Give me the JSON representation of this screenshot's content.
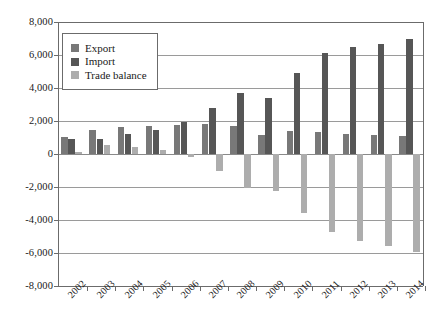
{
  "chart_data": {
    "type": "bar",
    "title": "",
    "subtitle": "",
    "xlabel": "",
    "ylabel": "",
    "categories": [
      "2002",
      "2003",
      "2004",
      "2005",
      "2006",
      "2007",
      "2008",
      "2009",
      "2010",
      "2011",
      "2012",
      "2013",
      "2014"
    ],
    "series": [
      {
        "name": "Export",
        "color": "#787878",
        "values": [
          1050,
          1430,
          1620,
          1700,
          1750,
          1830,
          1680,
          1150,
          1390,
          1340,
          1210,
          1180,
          1090
        ]
      },
      {
        "name": "Import",
        "color": "#565656",
        "values": [
          930,
          880,
          1240,
          1430,
          1950,
          2800,
          3720,
          3380,
          4900,
          6100,
          6500,
          6650,
          6950
        ]
      },
      {
        "name": "Trade balance",
        "color": "#adadad",
        "values": [
          100,
          550,
          400,
          250,
          -200,
          -1050,
          -2050,
          -2250,
          -3550,
          -4750,
          -5300,
          -5550,
          -5950
        ]
      }
    ],
    "ylim": [
      -8000,
      8000
    ],
    "yticks": [
      8000,
      6000,
      4000,
      2000,
      0,
      -2000,
      -4000,
      -6000,
      -8000
    ],
    "ytick_labels": [
      "8,000",
      "6,000",
      "4,000",
      "2,000",
      "0",
      "-2,000",
      "-4,000",
      "-6,000",
      "-8,000"
    ],
    "grid": true,
    "legend_position": "top-left",
    "legend_entries": [
      "Export",
      "Import",
      "Trade balance"
    ]
  }
}
